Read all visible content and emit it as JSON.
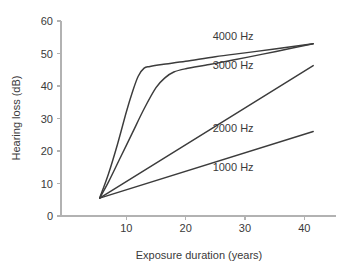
{
  "chart_data": {
    "type": "line",
    "title": "",
    "xlabel": "Exposure duration (years)",
    "ylabel": "Hearing loss (dB)",
    "xlim": [
      0,
      45
    ],
    "ylim": [
      0,
      60
    ],
    "xticks": [
      10,
      20,
      30,
      40
    ],
    "yticks": [
      0,
      10,
      20,
      30,
      40,
      50,
      60
    ],
    "xtick_labels": [
      "10",
      "20",
      "30",
      "40"
    ],
    "ytick_labels": [
      "0",
      "10",
      "20",
      "30",
      "40",
      "50",
      "60"
    ],
    "grid": false,
    "legend_position": "inline-annotations",
    "line_color": "#3c3c3c",
    "axis_color": "#b2b2b2",
    "background_color": "#ffffff",
    "common_origin": {
      "x": 5.5,
      "y": 5.5
    },
    "series": [
      {
        "name": "4000 Hz",
        "label": "4000 Hz",
        "label_x": 28,
        "label_y": 55.5,
        "x": [
          5.5,
          7,
          8.5,
          10,
          11,
          12,
          13,
          14,
          16,
          20,
          25,
          30,
          35,
          41.5
        ],
        "y": [
          5.5,
          13,
          22,
          32,
          38,
          43,
          45.5,
          46,
          46.6,
          47.6,
          49,
          50.2,
          51.4,
          53
        ]
      },
      {
        "name": "3000 Hz",
        "label": "3000 Hz",
        "label_x": 28,
        "label_y": 46.5,
        "x": [
          5.5,
          7,
          9,
          11,
          13,
          15,
          16.5,
          18,
          20,
          24,
          28,
          33,
          37,
          41.5
        ],
        "y": [
          5.5,
          10.5,
          18,
          25.5,
          33,
          39.5,
          42.5,
          44.3,
          45.3,
          46.6,
          48,
          49.8,
          51.3,
          53
        ]
      },
      {
        "name": "2000 Hz",
        "label": "2000 Hz",
        "label_x": 28,
        "label_y": 27,
        "x": [
          5.5,
          41.5
        ],
        "y": [
          5.5,
          46.3
        ]
      },
      {
        "name": "1000 Hz",
        "label": "1000 Hz",
        "label_x": 28,
        "label_y": 15,
        "x": [
          5.5,
          41.5
        ],
        "y": [
          5.5,
          26
        ]
      }
    ]
  }
}
